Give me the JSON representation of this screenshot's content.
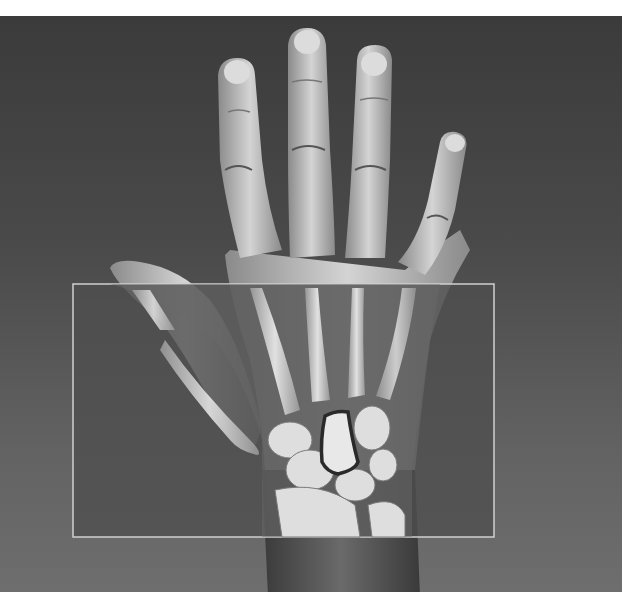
{
  "image": {
    "subject": "hand-with-xray-overlay",
    "description": "Photograph of an open left hand against a gray backdrop with a rectangular X-ray window over the palm and wrist revealing metacarpals and carpal bones; one carpal bone (capitate) is outlined in dark stroke.",
    "colors": {
      "background_top": "#3b3b3b",
      "background_bottom": "#6e6e6e",
      "skin_light": "#d8d8d8",
      "skin_mid": "#a8a8a8",
      "xray_window": "#575757",
      "xray_border": "#d0d0d0",
      "bone": "#e6e6e6",
      "highlight_outline": "#2a2a2a"
    },
    "overlay": {
      "x": 73,
      "y": 284,
      "width": 421,
      "height": 253
    },
    "highlighted_bone": "capitate"
  }
}
